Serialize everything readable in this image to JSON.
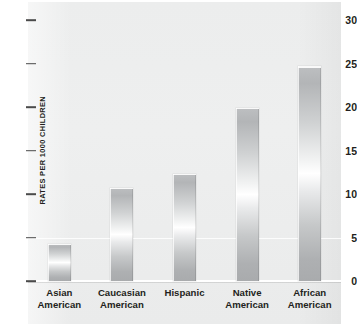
{
  "chart_data": {
    "type": "bar",
    "title": "",
    "xlabel": "",
    "ylabel": "RATES PER 1000 CHILDREN",
    "ylim": [
      0,
      30
    ],
    "ytick_step": 5,
    "grid": true,
    "legend": "none",
    "orientation": "vertical",
    "categories": [
      "Asian American",
      "Caucasian American",
      "Hispanic",
      "Native American",
      "African American"
    ],
    "category_lines": [
      [
        "Asian",
        "American"
      ],
      [
        "Caucasian",
        "American"
      ],
      [
        "Hispanic",
        ""
      ],
      [
        "Native",
        "American"
      ],
      [
        "African",
        "American"
      ]
    ],
    "values": [
      4.3,
      10.7,
      12.3,
      19.9,
      24.7
    ],
    "ticks": [
      "30",
      "25",
      "20",
      "15",
      "10",
      "5",
      "0"
    ],
    "tick_values": [
      30,
      25,
      20,
      15,
      10,
      5,
      0
    ]
  },
  "colors": {
    "panel_background": "#eeefef",
    "bar_edge": "#b3b5b7",
    "bar_highlight": "#ffffff",
    "text": "#231f20",
    "axis": "#4a4a4a",
    "gridline": "#ffffff"
  }
}
